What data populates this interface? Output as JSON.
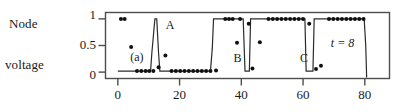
{
  "axis": {
    "ylabel_lines": [
      "Node",
      "voltage"
    ],
    "yticks": [
      {
        "value": 1,
        "label": "1"
      },
      {
        "value": 0.5,
        "label": "0.5"
      },
      {
        "value": 0,
        "label": "0"
      }
    ],
    "xticks": [
      {
        "value": 0,
        "label": "0"
      },
      {
        "value": 20,
        "label": "20"
      },
      {
        "value": 40,
        "label": "40"
      },
      {
        "value": 60,
        "label": "60"
      },
      {
        "value": 80,
        "label": "80"
      }
    ],
    "xlim": [
      -4,
      88
    ],
    "ylim": [
      -0.12,
      1.12
    ],
    "xlabel": "",
    "grid": false,
    "frame": true
  },
  "annotations": [
    {
      "name": "panel-label",
      "text": "(a)",
      "x": 4,
      "y": 0.26,
      "italic": false
    },
    {
      "name": "label-a",
      "text": "A",
      "x": 15.5,
      "y": 0.87,
      "italic": false
    },
    {
      "name": "label-b",
      "text": "B",
      "x": 37.5,
      "y": 0.24,
      "italic": false
    },
    {
      "name": "label-c",
      "text": "C",
      "x": 59.0,
      "y": 0.24,
      "italic": false
    },
    {
      "name": "time-label",
      "text": "t = 8",
      "x": 69.0,
      "y": 0.52,
      "italic": true
    }
  ],
  "chart_data": {
    "type": "line",
    "title": "",
    "xlabel": "",
    "ylabel": "Node voltage",
    "xlim": [
      -4,
      88
    ],
    "ylim": [
      -0.12,
      1.12
    ],
    "grid": false,
    "legend": null,
    "series": [
      {
        "name": "node-voltage-waveform",
        "kind": "line",
        "x": [
          0.0,
          10.6,
          11.0,
          12.0,
          12.6,
          13.2,
          13.6,
          30.0,
          30.6,
          31.0,
          40.6,
          41.2,
          42.6,
          43.0,
          60.6,
          61.0,
          63.2,
          63.6,
          79.8,
          80.3,
          80.6
        ],
        "y": [
          0.02,
          0.02,
          0.35,
          1.0,
          1.0,
          0.35,
          0.02,
          0.02,
          0.45,
          1.0,
          1.0,
          0.02,
          0.02,
          1.0,
          1.0,
          0.02,
          0.02,
          1.0,
          1.0,
          0.5,
          -0.1
        ]
      },
      {
        "name": "node-voltage-samples",
        "kind": "scatter",
        "x": [
          1.0,
          2.2,
          4.3,
          6.2,
          7.6,
          9.0,
          10.2,
          11.5,
          13.2,
          15.4,
          17.4,
          18.8,
          20.2,
          21.6,
          23.0,
          24.4,
          25.8,
          27.2,
          28.6,
          30.0,
          31.8,
          34.8,
          36.0,
          37.2,
          38.6,
          39.6,
          42.4,
          43.6,
          46.0,
          48.8,
          50.2,
          51.6,
          53.0,
          54.4,
          55.8,
          57.2,
          58.6,
          60.0,
          62.0,
          64.2,
          65.8,
          68.4,
          69.8,
          71.2,
          72.6,
          74.0,
          75.4,
          76.8,
          78.2,
          79.6
        ],
        "y": [
          1.0,
          1.0,
          0.47,
          0.02,
          0.02,
          0.02,
          0.02,
          0.02,
          0.09,
          0.31,
          0.02,
          0.02,
          0.02,
          0.02,
          0.02,
          0.02,
          0.02,
          0.02,
          0.02,
          0.02,
          0.03,
          1.0,
          1.0,
          1.0,
          0.55,
          1.0,
          0.91,
          0.07,
          0.56,
          1.0,
          1.0,
          1.0,
          1.0,
          1.0,
          1.0,
          1.0,
          1.0,
          1.0,
          0.91,
          0.06,
          0.12,
          1.0,
          1.0,
          1.0,
          1.0,
          1.0,
          1.0,
          1.0,
          1.0,
          1.0
        ]
      }
    ]
  },
  "colors": {
    "line": "#2b2b2b",
    "marker": "#111111",
    "frame": "#4d4d4d",
    "text": "#1a1a1a",
    "background": "#ffffff"
  }
}
